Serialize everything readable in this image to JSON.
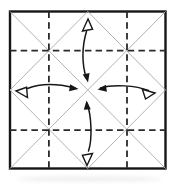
{
  "diagram": {
    "name": "origami-crease-pattern",
    "canvas": {
      "width": 176,
      "height": 187
    },
    "colors": {
      "paper": "#ffffff",
      "border": "#161616",
      "crease": "#b4b4b4",
      "valley_dash": "#2a2a2a",
      "arrow": "#161616",
      "open_head_fill": "#ffffff"
    },
    "square": {
      "x": 10,
      "y": 11.5,
      "w": 155.5,
      "h": 157,
      "border_width": 2.4
    },
    "crease_lines": [
      {
        "name": "diagonal-tl-br",
        "x1": 10,
        "y1": 11.5,
        "x2": 165.5,
        "y2": 168.5
      },
      {
        "name": "diagonal-tr-bl",
        "x1": 165.5,
        "y1": 11.5,
        "x2": 10,
        "y2": 168.5
      },
      {
        "name": "diamond-top-right",
        "x1": 87.75,
        "y1": 11.5,
        "x2": 165.5,
        "y2": 90
      },
      {
        "name": "diamond-right-bottom",
        "x1": 165.5,
        "y1": 90,
        "x2": 87.75,
        "y2": 168.5
      },
      {
        "name": "diamond-bottom-left",
        "x1": 87.75,
        "y1": 168.5,
        "x2": 10,
        "y2": 90
      },
      {
        "name": "diamond-left-top",
        "x1": 10,
        "y1": 90,
        "x2": 87.75,
        "y2": 11.5
      }
    ],
    "valley_fold_lines": [
      {
        "name": "valley-vertical-left",
        "x1": 48.9,
        "y1": 11.5,
        "x2": 48.9,
        "y2": 168.5
      },
      {
        "name": "valley-vertical-right",
        "x1": 127.0,
        "y1": 11.5,
        "x2": 127.0,
        "y2": 168.5
      },
      {
        "name": "valley-horizontal-top",
        "x1": 10,
        "y1": 50.7,
        "x2": 165.5,
        "y2": 50.7
      },
      {
        "name": "valley-horizontal-bottom",
        "x1": 10,
        "y1": 130.2,
        "x2": 165.5,
        "y2": 130.2
      }
    ],
    "dash_pattern": "6.5 4.2",
    "valley_width": 1.8,
    "crease_width": 1,
    "arrow_width": 1.5,
    "arrows": [
      {
        "name": "fold-arrow-top",
        "direction": "top-to-center",
        "arc": "M86.5,31.5 C82,46 81.5,64 86.5,78.5",
        "solid_head": {
          "x": 88,
          "y": 82.5,
          "angle": 78
        },
        "open_head": {
          "x": 88,
          "y": 19,
          "angle": -90
        }
      },
      {
        "name": "fold-arrow-bottom",
        "direction": "bottom-to-center",
        "arc": "M87,103 C91.5,116 92.5,139 88.5,151",
        "solid_head": {
          "x": 86.5,
          "y": 100.5,
          "angle": -95
        },
        "open_head": {
          "x": 87,
          "y": 165.5,
          "angle": 90
        }
      },
      {
        "name": "fold-arrow-left",
        "direction": "left-to-center",
        "arc": "M27.5,88.5 C41,83 59,84 75,88",
        "solid_head": {
          "x": 78.5,
          "y": 89,
          "angle": 8
        },
        "open_head": {
          "x": 16,
          "y": 91,
          "angle": 185
        }
      },
      {
        "name": "fold-arrow-right",
        "direction": "right-to-center",
        "arc": "M100.5,88 C113,84 136,85.5 148.5,90.5",
        "solid_head": {
          "x": 97.5,
          "y": 89.5,
          "angle": 172
        },
        "open_head": {
          "x": 155,
          "y": 93,
          "angle": -8
        }
      }
    ],
    "head_shapes": {
      "solid": "M0,0 L-9,-3.5 L-9,3.5 Z",
      "open": "M0,0 L-12,-5.5 L-10.2,4.6 Z"
    }
  }
}
